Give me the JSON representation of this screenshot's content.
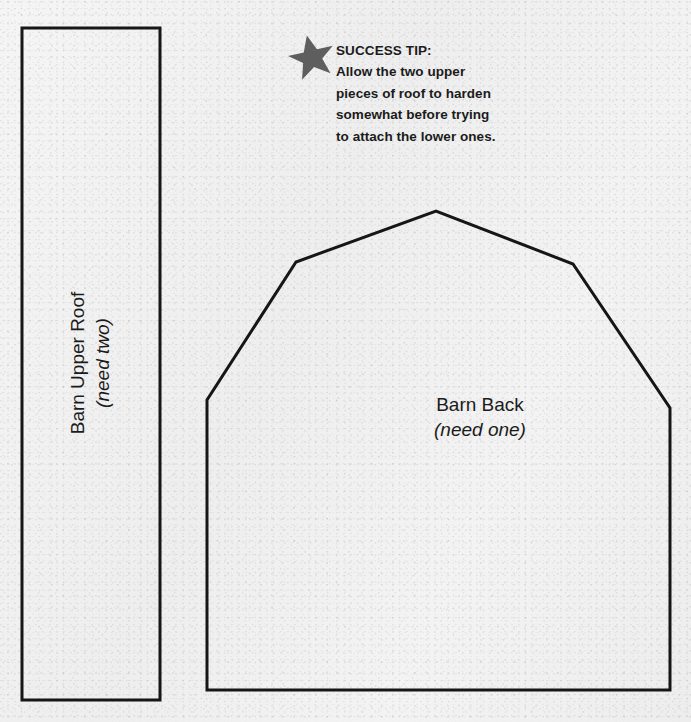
{
  "page": {
    "background_color": "#f1f1f1",
    "ink_color": "#161616",
    "star_color": "#5e5e5e"
  },
  "tip": {
    "icon": "star-icon",
    "title": "SUCCESS TIP:",
    "lines": [
      "Allow the two upper",
      "pieces of roof to harden",
      "somewhat before trying",
      "to attach the lower ones."
    ]
  },
  "pieces": [
    {
      "id": "barn-upper-roof",
      "name": "Barn Upper Roof",
      "quantity_note": "(need two)",
      "shape": "rectangle"
    },
    {
      "id": "barn-back",
      "name": "Barn Back",
      "quantity_note": "(need one)",
      "shape": "barn-silhouette"
    }
  ],
  "shapes": {
    "roof_rect": {
      "x": 22,
      "y": 28,
      "width": 138,
      "height": 672,
      "stroke_width": 3
    },
    "barn_back_points": "207,699 207,400 296,262 436,211 573,264 670,408 670,690 207,690",
    "barn_back_outline": [
      [
        207,
        400
      ],
      [
        296,
        262
      ],
      [
        436,
        211
      ],
      [
        573,
        264
      ],
      [
        670,
        408
      ],
      [
        670,
        690
      ],
      [
        207,
        690
      ]
    ],
    "stroke_width": 3
  }
}
